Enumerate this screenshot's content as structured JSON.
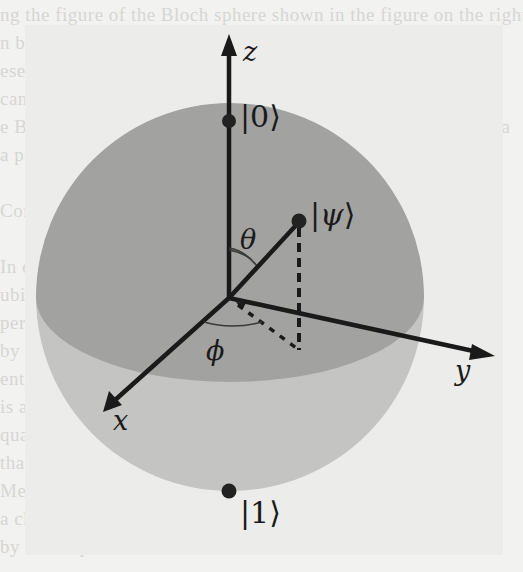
{
  "figure": {
    "title": "Bloch sphere",
    "colors": {
      "background": "#f2f2f0",
      "sphere_upper": "#9f9f9f",
      "sphere_lower": "#c2c2c2",
      "equator_front": "#b0b0b0",
      "axis": "#1a1a1a",
      "dot": "#222222",
      "arc": "#3a3a3a"
    },
    "axes": {
      "z_label": "z",
      "x_label": "x",
      "y_label": "y"
    },
    "states": {
      "zero": {
        "bar": "|",
        "symbol": "0",
        "angle": "⟩"
      },
      "one": {
        "bar": "|",
        "symbol": "1",
        "angle": "⟩"
      },
      "psi": {
        "bar": "|",
        "symbol": "ψ",
        "angle": "⟩"
      }
    },
    "angles": {
      "theta_label": "θ",
      "phi_label": "ϕ"
    },
    "background_text_lines": [
      "ng the figure of the Bloch sphere shown in the figure on the right, one",
      "n be like what is shown below. The other states are seen from",
      "ese states are not as simple and require a larger description",
      "can be visualized geometrically as points on the Bloch sph",
      "e Bloch sphere provides a representation of any qubit state as a",
      "a point.",
      "",
      "Comput",
      "",
      "In classical computing, information is stored in bits",
      "ubits instead use quantum states that can exist in a",
      "perposition of the basis states, and are manipulated",
      "by unitary gates. The qubit state may also become",
      "entangled with other qubits, and such entanglement",
      "is a key resource for quantum algorithms and",
      "quantum communication protocols, enabling tasks",
      "that are intractable for classical systems.",
      "Measurement collapses the superposition and yields",
      "a classical outcome with probabilities determined",
      "by the amplitudes of the state vector."
    ]
  }
}
